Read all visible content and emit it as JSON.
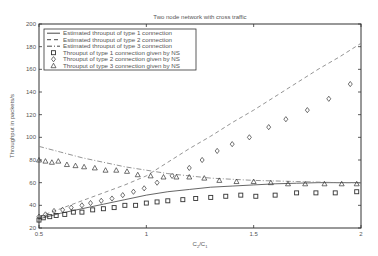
{
  "chart_data": {
    "type": "line",
    "title": "Two node network with cross traffic",
    "xlabel": "C2/C1",
    "ylabel": "Throughput in packets/s",
    "xlim": [
      0.5,
      2
    ],
    "ylim": [
      20,
      200
    ],
    "xticks": [
      0.5,
      1,
      1.5,
      2
    ],
    "xtick_labels": [
      "0.5",
      "1",
      "1.5",
      "2"
    ],
    "yticks": [
      20,
      40,
      60,
      80,
      100,
      120,
      140,
      160,
      180,
      200
    ],
    "ytick_labels": [
      "20",
      "40",
      "60",
      "80",
      "100",
      "120",
      "140",
      "160",
      "180",
      "200"
    ],
    "grid": false,
    "legend_position": "upper left",
    "series": [
      {
        "name": "Estimated throuput of type 1 connection",
        "style": "solid",
        "marker": "none",
        "x": [
          0.5,
          0.6,
          0.7,
          0.8,
          0.9,
          1.0,
          1.1,
          1.2,
          1.3,
          1.4,
          1.5,
          1.6,
          1.7,
          1.8,
          1.9,
          2.0
        ],
        "values": [
          28,
          33,
          37,
          41,
          45,
          49,
          52,
          54,
          56,
          57,
          58,
          59,
          59.5,
          60,
          60,
          60
        ]
      },
      {
        "name": "Estimated throuput of type 2 connection",
        "style": "dashed",
        "marker": "none",
        "x": [
          0.5,
          0.6,
          0.7,
          0.8,
          0.9,
          1.0,
          1.1,
          1.2,
          1.3,
          1.4,
          1.5,
          1.6,
          1.7,
          1.8,
          1.9,
          2.0
        ],
        "values": [
          30,
          37,
          44,
          51,
          58,
          66,
          78,
          90,
          101,
          113,
          124,
          136,
          148,
          160,
          171,
          183
        ]
      },
      {
        "name": "Estimated throuput of type 3 connection",
        "style": "dashdot",
        "marker": "none",
        "x": [
          0.5,
          0.6,
          0.7,
          0.8,
          0.9,
          1.0,
          1.1,
          1.2,
          1.3,
          1.4,
          1.5,
          1.6,
          1.7,
          1.8,
          1.9,
          2.0
        ],
        "values": [
          92,
          87,
          82,
          78,
          74,
          71,
          68,
          66,
          64,
          63,
          62,
          61.5,
          61,
          60.5,
          60,
          60
        ]
      },
      {
        "name": "Throuput of type 1 connection given by NS",
        "style": "none",
        "marker": "square",
        "x": [
          0.5,
          0.52,
          0.55,
          0.58,
          0.62,
          0.66,
          0.7,
          0.75,
          0.8,
          0.85,
          0.9,
          0.95,
          1.0,
          1.05,
          1.1,
          1.17,
          1.23,
          1.3,
          1.37,
          1.44,
          1.51,
          1.6,
          1.7,
          1.79,
          1.88,
          1.98
        ],
        "values": [
          27,
          29,
          30,
          31,
          32,
          34,
          34,
          36,
          37,
          38,
          40,
          40,
          42,
          43,
          44,
          45,
          46,
          47,
          48,
          49,
          48,
          49,
          51,
          51,
          51,
          52
        ]
      },
      {
        "name": "Throuput of type 2 connection given by NS",
        "style": "none",
        "marker": "diamond",
        "x": [
          0.5,
          0.53,
          0.57,
          0.61,
          0.65,
          0.7,
          0.74,
          0.79,
          0.84,
          0.89,
          0.94,
          0.99,
          1.05,
          1.12,
          1.2,
          1.26,
          1.33,
          1.4,
          1.48,
          1.57,
          1.65,
          1.75,
          1.85,
          1.95
        ],
        "values": [
          30,
          32,
          35,
          36,
          38,
          40,
          42,
          44,
          46,
          49,
          52,
          55,
          60,
          66,
          73,
          80,
          88,
          94,
          100,
          109,
          116,
          124,
          134,
          147
        ]
      },
      {
        "name": "Throuput of type 3 connection given by NS",
        "style": "none",
        "marker": "triangle",
        "x": [
          0.5,
          0.53,
          0.56,
          0.59,
          0.63,
          0.67,
          0.71,
          0.76,
          0.81,
          0.86,
          0.91,
          0.96,
          1.02,
          1.08,
          1.14,
          1.2,
          1.27,
          1.34,
          1.42,
          1.5,
          1.58,
          1.66,
          1.74,
          1.83,
          1.91,
          1.98
        ],
        "values": [
          80,
          79,
          78,
          79,
          76,
          75,
          74,
          73,
          71,
          71,
          70,
          67,
          66,
          65,
          65,
          65,
          64,
          62,
          61,
          61,
          60,
          59,
          59,
          59,
          59,
          59
        ]
      }
    ]
  }
}
